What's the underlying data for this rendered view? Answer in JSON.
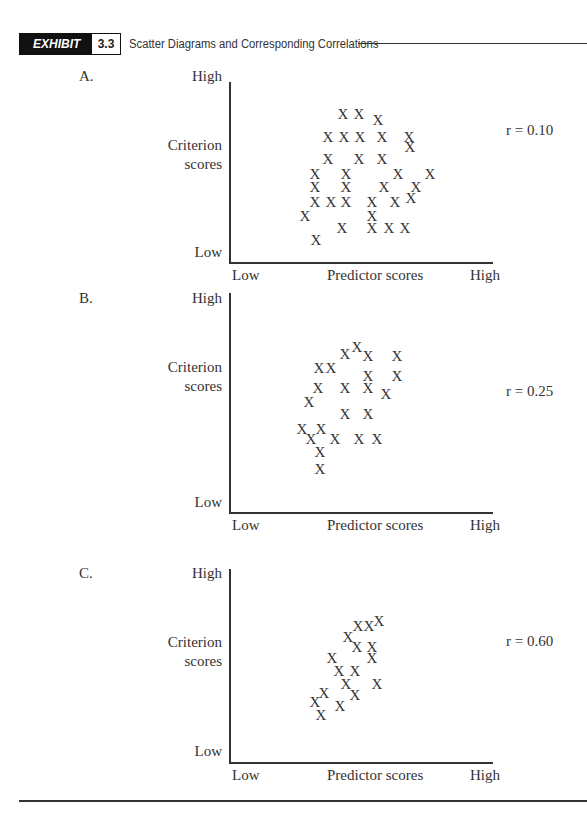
{
  "header": {
    "exhibit_label": "EXHIBIT",
    "exhibit_number": "3.3",
    "title": "Scatter Diagrams and Corresponding Correlations"
  },
  "axis_labels": {
    "y_high": "High",
    "y_low": "Low",
    "y_title_line1": "Criterion",
    "y_title_line2": "scores",
    "x_low": "Low",
    "x_title": "Predictor scores",
    "x_high": "High"
  },
  "panels": [
    {
      "letter": "A.",
      "r_label": "r = 0.10"
    },
    {
      "letter": "B.",
      "r_label": "r = 0.25"
    },
    {
      "letter": "C.",
      "r_label": "r = 0.60"
    }
  ],
  "chart_data": [
    {
      "type": "scatter",
      "title": "A.",
      "annotation": "r = 0.10",
      "marker": "X",
      "xlabel": "Predictor scores",
      "ylabel": "Criterion scores",
      "x_ticks": [
        "Low",
        "High"
      ],
      "y_ticks": [
        "Low",
        "High"
      ],
      "xlim": [
        0,
        264
      ],
      "ylim": [
        0,
        165
      ],
      "grid": false,
      "points": [
        [
          114,
          154
        ],
        [
          130,
          154
        ],
        [
          149,
          148
        ],
        [
          99,
          131
        ],
        [
          115,
          131
        ],
        [
          131,
          131
        ],
        [
          153,
          131
        ],
        [
          180,
          131
        ],
        [
          181,
          121
        ],
        [
          99,
          109
        ],
        [
          130,
          109
        ],
        [
          153,
          109
        ],
        [
          86,
          94
        ],
        [
          117,
          94
        ],
        [
          169,
          94
        ],
        [
          201,
          94
        ],
        [
          86,
          81
        ],
        [
          117,
          81
        ],
        [
          155,
          81
        ],
        [
          187,
          81
        ],
        [
          86,
          66
        ],
        [
          102,
          66
        ],
        [
          117,
          66
        ],
        [
          143,
          66
        ],
        [
          166,
          66
        ],
        [
          182,
          70
        ],
        [
          76,
          52
        ],
        [
          143,
          52
        ],
        [
          113,
          40
        ],
        [
          143,
          40
        ],
        [
          160,
          40
        ],
        [
          176,
          40
        ],
        [
          87,
          28
        ]
      ]
    },
    {
      "type": "scatter",
      "title": "B.",
      "annotation": "r = 0.25",
      "marker": "X",
      "xlabel": "Predictor scores",
      "ylabel": "Criterion scores",
      "x_ticks": [
        "Low",
        "High"
      ],
      "y_ticks": [
        "Low",
        "High"
      ],
      "xlim": [
        0,
        264
      ],
      "ylim": [
        0,
        165
      ],
      "grid": false,
      "points": [
        [
          128,
          154
        ],
        [
          116,
          147
        ],
        [
          139,
          145
        ],
        [
          168,
          145
        ],
        [
          90,
          133
        ],
        [
          102,
          133
        ],
        [
          139,
          125
        ],
        [
          168,
          125
        ],
        [
          89,
          113
        ],
        [
          116,
          113
        ],
        [
          139,
          113
        ],
        [
          157,
          107
        ],
        [
          80,
          99
        ],
        [
          116,
          87
        ],
        [
          139,
          87
        ],
        [
          73,
          72
        ],
        [
          92,
          72
        ],
        [
          82,
          62
        ],
        [
          106,
          62
        ],
        [
          130,
          62
        ],
        [
          148,
          62
        ],
        [
          91,
          49
        ],
        [
          91,
          32
        ]
      ]
    },
    {
      "type": "scatter",
      "title": "C.",
      "annotation": "r = 0.60",
      "marker": "X",
      "xlabel": "Predictor scores",
      "ylabel": "Criterion scores",
      "x_ticks": [
        "Low",
        "High"
      ],
      "y_ticks": [
        "Low",
        "High"
      ],
      "xlim": [
        0,
        264
      ],
      "ylim": [
        0,
        165
      ],
      "grid": false,
      "points": [
        [
          150,
          150
        ],
        [
          129,
          145
        ],
        [
          140,
          145
        ],
        [
          119,
          134
        ],
        [
          128,
          124
        ],
        [
          143,
          124
        ],
        [
          103,
          113
        ],
        [
          143,
          113
        ],
        [
          110,
          100
        ],
        [
          126,
          100
        ],
        [
          117,
          87
        ],
        [
          148,
          87
        ],
        [
          95,
          78
        ],
        [
          126,
          76
        ],
        [
          86,
          69
        ],
        [
          111,
          65
        ],
        [
          92,
          56
        ]
      ]
    }
  ]
}
